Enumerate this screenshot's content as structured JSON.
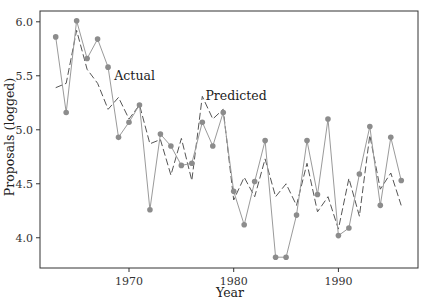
{
  "chart_data": {
    "type": "line",
    "title": "",
    "xlabel": "Year",
    "ylabel": "Proposals (logged)",
    "xlim": [
      1961.5,
      1997.6
    ],
    "ylim": [
      3.72,
      6.1
    ],
    "xticks": [
      1970,
      1980,
      1990
    ],
    "xtick_labels": [
      "1970",
      "1980",
      "1990"
    ],
    "yticks": [
      4.0,
      4.5,
      5.0,
      5.5,
      6.0
    ],
    "ytick_labels": [
      "4.0",
      "4.5",
      "5.0",
      "5.5",
      "6.0"
    ],
    "grid": false,
    "legend": "none (inline annotations)",
    "annotations": [
      {
        "text": "Actual",
        "x": 1968.6,
        "y": 5.5
      },
      {
        "text": "Predicted",
        "x": 1977.3,
        "y": 5.31
      }
    ],
    "x": [
      1963,
      1964,
      1965,
      1966,
      1967,
      1968,
      1969,
      1970,
      1971,
      1972,
      1973,
      1974,
      1975,
      1976,
      1977,
      1978,
      1979,
      1980,
      1981,
      1982,
      1983,
      1984,
      1985,
      1986,
      1987,
      1988,
      1989,
      1990,
      1991,
      1992,
      1993,
      1994,
      1995,
      1996
    ],
    "series": [
      {
        "name": "Actual",
        "style": "solid line with dot markers",
        "values": [
          5.86,
          5.16,
          6.01,
          5.66,
          5.84,
          5.58,
          4.93,
          5.07,
          5.23,
          4.26,
          4.96,
          4.85,
          4.67,
          4.69,
          5.07,
          4.85,
          5.16,
          4.43,
          4.12,
          4.52,
          4.9,
          3.82,
          3.82,
          4.21,
          4.9,
          4.4,
          5.1,
          4.02,
          4.09,
          4.59,
          5.03,
          4.3,
          4.93,
          4.53
        ]
      },
      {
        "name": "Predicted",
        "style": "dashed line",
        "values": [
          5.39,
          5.43,
          5.92,
          5.56,
          5.43,
          5.19,
          5.3,
          5.1,
          5.23,
          4.87,
          4.91,
          4.58,
          4.92,
          4.53,
          5.31,
          5.1,
          5.19,
          4.35,
          4.56,
          4.38,
          4.73,
          4.38,
          4.5,
          4.3,
          4.69,
          4.24,
          4.38,
          4.08,
          4.55,
          4.2,
          4.95,
          4.45,
          4.6,
          4.3
        ]
      }
    ]
  },
  "colors": {
    "actual_line": "#9a9a9a",
    "marker": "#8c8c8c",
    "predicted_line": "#555555",
    "frame": "#333333"
  }
}
